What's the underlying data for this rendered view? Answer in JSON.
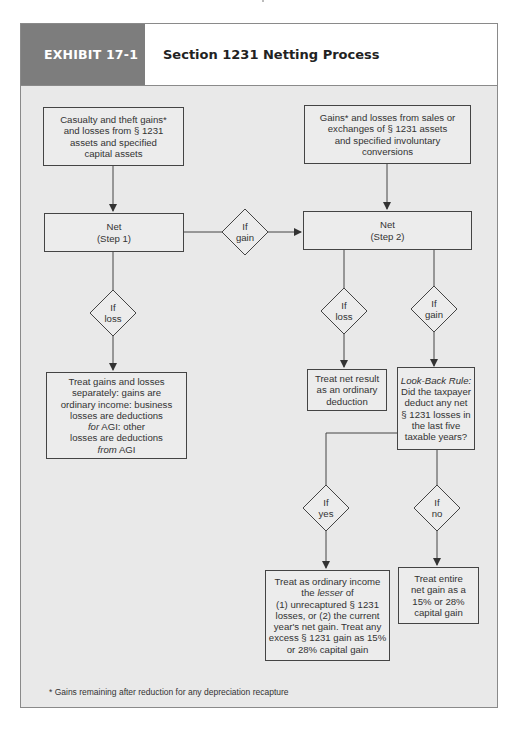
{
  "exhibit": {
    "label": "EXHIBIT 17-1",
    "title": "Section 1231 Netting Process"
  },
  "colors": {
    "header_label_bg": "#7d7d7d",
    "panel_bg": "#e9e9e9",
    "line": "#444444"
  },
  "nodes": {
    "casualty": "Casualty and theft gains*\nand losses from § 1231\nassets and specified\ncapital assets",
    "sales": "Gains* and losses from sales or\nexchanges of § 1231 assets\nand specified involuntary\nconversions",
    "net1": "Net\n(Step 1)",
    "net2": "Net\n(Step 2)",
    "separate_treatment_lines": [
      "Treat gains and losses",
      "separately: gains are",
      "ordinary income: business",
      "losses are deductions"
    ],
    "separate_treatment_for_em": "for",
    "separate_treatment_for_rest": " AGI: other",
    "separate_treatment_line6": "losses are deductions",
    "separate_treatment_from_em": "from",
    "separate_treatment_from_rest": " AGI",
    "ordinary_deduction": "Treat net result\nas an ordinary\ndeduction",
    "lookback_title": "Look-Back Rule:",
    "lookback_body": "Did the taxpayer\ndeduct any net\n§ 1231 losses in\nthe last five\ntaxable years?",
    "ordinary_income_line1": "Treat as ordinary income",
    "ordinary_income_the": "the ",
    "ordinary_income_lesser": "lesser",
    "ordinary_income_of": " of",
    "ordinary_income_rest": "(1) unrecaptured § 1231\nlosses, or (2) the current\nyear's net gain. Treat any\nexcess § 1231 gain as 15%\nor 28% capital gain",
    "capital_gain": "Treat entire\nnet gain as a\n15% or 28%\ncapital gain"
  },
  "decisions": {
    "step1_gain": "If\ngain",
    "step1_loss": "If\nloss",
    "step2_loss": "If\nloss",
    "step2_gain": "If\ngain",
    "lookback_yes": "If\nyes",
    "lookback_no": "If\nno"
  },
  "footnote": "* Gains remaining after reduction for any depreciation recapture"
}
